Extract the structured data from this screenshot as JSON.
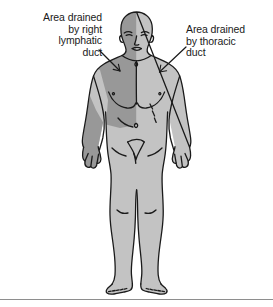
{
  "figure": {
    "type": "anatomical-diagram",
    "width": 273,
    "height": 307,
    "background_color": "#ffffff"
  },
  "labels": {
    "left": {
      "text": "Area drained\nby right\nlymphatic\nduct",
      "lines": [
        "Area drained",
        "by right",
        "lymphatic",
        "duct"
      ],
      "align": "right",
      "points_to": "right-upper-quadrant"
    },
    "right": {
      "text": "Area drained\nby thoracic\nduct",
      "lines": [
        "Area drained",
        "by thoracic",
        "duct"
      ],
      "align": "left",
      "points_to": "left-shoulder-and-rest-of-body"
    }
  },
  "shading": {
    "dark_region_color": "#989898",
    "light_region_color": "#c3c3c3",
    "outline_color": "#1a1a1a",
    "dark_region_name": "right-lymphatic-duct-territory",
    "light_region_name": "thoracic-duct-territory"
  },
  "leader_lines": {
    "left": {
      "from_x": 99,
      "from_y": 50,
      "to_x": 120,
      "to_y": 71
    },
    "right": {
      "from_x": 186,
      "from_y": 47,
      "to_x": 160,
      "to_y": 72
    }
  },
  "rule": {
    "color": "#8e8e8e",
    "y": 299
  }
}
